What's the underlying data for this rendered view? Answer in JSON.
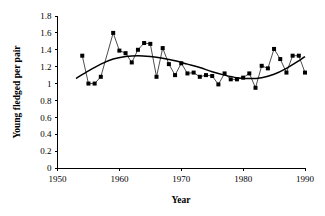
{
  "chart_data": {
    "type": "line",
    "title": "",
    "subtitle": "",
    "xlabel": "Year",
    "ylabel": "Young fledged per pair",
    "xlim": [
      1950,
      1990
    ],
    "ylim": [
      0,
      1.8
    ],
    "xticks": [
      1950,
      1960,
      1970,
      1980,
      1990
    ],
    "xtick_labels": [
      "1950",
      "1960",
      "1970",
      "1980",
      "1990"
    ],
    "yticks": [
      0,
      0.2,
      0.4,
      0.6,
      0.8,
      1,
      1.2,
      1.4,
      1.6,
      1.8
    ],
    "ytick_labels": [
      "0",
      "0.2",
      "0.4",
      "0.6",
      "0.8",
      "1",
      "1.2",
      "1.4",
      "1.6",
      "1.8"
    ],
    "grid": false,
    "legend": false,
    "legend_position": "none",
    "marker": "square",
    "marker_color": "#000000",
    "line_color": "#000000",
    "trend_color": "#000000",
    "series": [
      {
        "name": "Young fledged per pair",
        "x": [
          1954,
          1955,
          1956,
          1957,
          1959,
          1960,
          1961,
          1962,
          1963,
          1964,
          1965,
          1966,
          1967,
          1968,
          1969,
          1970,
          1971,
          1972,
          1973,
          1974,
          1975,
          1976,
          1977,
          1978,
          1979,
          1980,
          1981,
          1982,
          1983,
          1984,
          1985,
          1986,
          1987,
          1988,
          1989,
          1990
        ],
        "values": [
          1.33,
          1.0,
          1.0,
          1.08,
          1.6,
          1.39,
          1.36,
          1.25,
          1.4,
          1.48,
          1.47,
          1.08,
          1.42,
          1.23,
          1.1,
          1.24,
          1.12,
          1.13,
          1.08,
          1.1,
          1.09,
          0.99,
          1.12,
          1.05,
          1.05,
          1.07,
          1.12,
          0.95,
          1.21,
          1.18,
          1.41,
          1.29,
          1.13,
          1.33,
          1.33,
          1.13
        ]
      }
    ],
    "trend": {
      "name": "fitted polynomial trend",
      "x": [
        1953,
        1955,
        1957,
        1959,
        1961,
        1963,
        1965,
        1967,
        1969,
        1971,
        1973,
        1975,
        1977,
        1979,
        1981,
        1983,
        1985,
        1987,
        1989,
        1990
      ],
      "values": [
        1.06,
        1.15,
        1.23,
        1.29,
        1.32,
        1.33,
        1.32,
        1.3,
        1.27,
        1.23,
        1.19,
        1.14,
        1.1,
        1.07,
        1.06,
        1.07,
        1.11,
        1.18,
        1.27,
        1.32
      ]
    }
  }
}
